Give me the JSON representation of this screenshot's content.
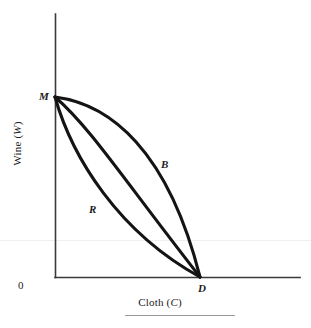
{
  "figure": {
    "kind": "production-possibility-frontier-diagram",
    "background_color": "#ffffff",
    "ink_color": "#1b1b1b",
    "width": 311,
    "height": 328
  },
  "axes": {
    "y_title_prefix": "Wine (",
    "y_title_symbol": "W",
    "y_title_suffix": ")",
    "y_title_full": "Wine (W)",
    "x_title_prefix": "Cloth (",
    "x_title_symbol": "C",
    "x_title_suffix": ")",
    "x_title_full": "Cloth (C)",
    "origin_label": "0",
    "y_axis": {
      "x": 55,
      "top": 14,
      "bottom": 277
    },
    "x_axis": {
      "y": 277,
      "left": 55,
      "right": 300
    }
  },
  "points": {
    "m": {
      "label": "M",
      "x": 55,
      "y": 97
    },
    "d": {
      "label": "D",
      "x": 200,
      "y": 277
    }
  },
  "curves": [
    {
      "id": "B",
      "label": "B",
      "shape": "convex-outer",
      "description": "outer frontier bowing up and to the right",
      "path": "M 55 97 C 110 104 168 150 200 277",
      "label_x": 161,
      "label_y": 159
    },
    {
      "id": "middle",
      "label": "",
      "shape": "near-straight",
      "description": "middle frontier, almost a straight chord from M to D",
      "path": "M 55 97 C 90 127 124 180 200 277",
      "label_x": null,
      "label_y": null
    },
    {
      "id": "R",
      "label": "R",
      "shape": "concave-inner",
      "description": "inner frontier bowing down and to the left",
      "path": "M 55 97 C 72 157 118 232 200 277",
      "label_x": 89,
      "label_y": 204
    }
  ],
  "chart_data": {
    "type": "line",
    "title": "",
    "xlabel": "Cloth (C)",
    "ylabel": "Wine (W)",
    "xlim": [
      0,
      1
    ],
    "ylim": [
      0,
      1
    ],
    "grid": false,
    "legend": "inline-curve-labels",
    "annotations": [
      "M",
      "D",
      "B",
      "R",
      "0"
    ],
    "endpoints": {
      "M": [
        0,
        1
      ],
      "D": [
        1,
        0
      ]
    },
    "series": [
      {
        "name": "B",
        "description": "outer (convex) production possibility frontier",
        "x": [
          0.0,
          0.1,
          0.25,
          0.4,
          0.55,
          0.7,
          0.82,
          0.92,
          1.0
        ],
        "y": [
          1.0,
          0.97,
          0.92,
          0.85,
          0.76,
          0.63,
          0.49,
          0.3,
          0.0
        ]
      },
      {
        "name": "middle",
        "description": "near-linear frontier",
        "x": [
          0.0,
          0.12,
          0.25,
          0.4,
          0.55,
          0.7,
          0.85,
          1.0
        ],
        "y": [
          1.0,
          0.88,
          0.76,
          0.62,
          0.48,
          0.34,
          0.18,
          0.0
        ]
      },
      {
        "name": "R",
        "description": "inner (concave) production possibility frontier",
        "x": [
          0.0,
          0.08,
          0.18,
          0.3,
          0.45,
          0.6,
          0.78,
          1.0
        ],
        "y": [
          1.0,
          0.78,
          0.6,
          0.44,
          0.31,
          0.21,
          0.11,
          0.0
        ]
      }
    ]
  },
  "footer": {
    "rule": {
      "left": 125,
      "right": 235,
      "y": 315
    }
  },
  "artifact": {
    "scan_line_y": 240
  }
}
